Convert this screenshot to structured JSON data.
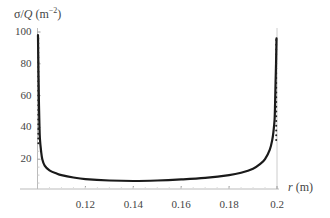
{
  "chart_data": {
    "type": "line",
    "title": "",
    "ylabel": "σ/Q (m⁻²)",
    "ylabel_parts": {
      "sigma": "σ",
      "slash": "/",
      "Q": "Q",
      "unit": " (m",
      "exp": "−2",
      "close": ")"
    },
    "xlabel": "r (m)",
    "xlabel_parts": {
      "r": "r",
      "unit": " (m)"
    },
    "xlim": [
      0.1,
      0.2
    ],
    "ylim": [
      0,
      100
    ],
    "x_ticks": [
      "0.12",
      "0.14",
      "0.16",
      "0.18",
      "0.2"
    ],
    "x_tick_values": [
      0.12,
      0.14,
      0.16,
      0.18,
      0.2
    ],
    "y_ticks": [
      "20",
      "40",
      "60",
      "80",
      "100"
    ],
    "y_tick_values": [
      20,
      40,
      60,
      80,
      100
    ],
    "grid": false,
    "series": [
      {
        "name": "σ/Q",
        "x": [
          0.1002,
          0.1004,
          0.1006,
          0.1008,
          0.101,
          0.1015,
          0.102,
          0.103,
          0.105,
          0.108,
          0.11,
          0.115,
          0.12,
          0.13,
          0.14,
          0.15,
          0.16,
          0.17,
          0.18,
          0.185,
          0.19,
          0.193,
          0.195,
          0.197,
          0.198,
          0.1985,
          0.199,
          0.1992,
          0.1994,
          0.1996,
          0.1998
        ],
        "values": [
          98,
          75,
          55,
          42,
          33,
          25,
          20,
          16,
          13,
          11,
          10,
          8.5,
          7.5,
          6.6,
          6.3,
          6.6,
          7.3,
          8.3,
          10,
          11.5,
          14,
          17,
          20,
          26,
          32,
          37,
          45,
          55,
          68,
          80,
          96
        ]
      }
    ]
  }
}
